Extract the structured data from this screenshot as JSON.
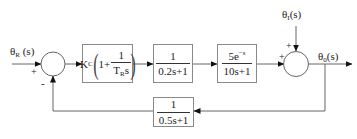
{
  "diagram": {
    "type": "control-system-block-diagram",
    "inputs": {
      "reference": {
        "symbol": "θ",
        "subscript": "R",
        "arg": " (s)"
      },
      "disturbance": {
        "symbol": "θ",
        "subscript": "I",
        "arg": "(s)"
      }
    },
    "output": {
      "symbol": "θ",
      "subscript": "0",
      "arg": "(s)"
    },
    "summing_junction_1": {
      "plus_sign": "+",
      "minus_sign": "-"
    },
    "summing_junction_2": {
      "plus_sign_left": "+",
      "plus_sign_top": "+"
    },
    "controller": {
      "gain": "K",
      "gain_subscript": "C",
      "one": "1+",
      "num": "1",
      "den_T": "T",
      "den_T_subscript": "R",
      "den_s": "s"
    },
    "block_actuator": {
      "num": "1",
      "den": "0.2s+1"
    },
    "block_process": {
      "num_coef": "5e",
      "num_exp": "−s",
      "den": "10s+1"
    },
    "block_feedback": {
      "num": "1",
      "den": "0.5s+1"
    },
    "colors": {
      "line": "#666666",
      "box_border": "#8a8a8a",
      "text": "#222222"
    }
  }
}
